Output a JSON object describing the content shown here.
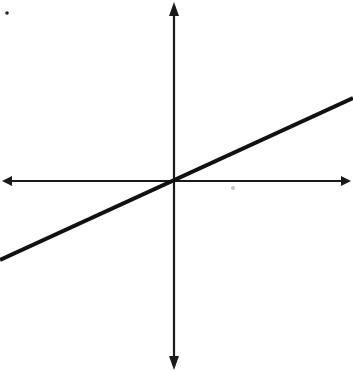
{
  "diagram": {
    "type": "coordinate-plane-linear-graph",
    "colors": {
      "background": "#ffffff",
      "axis": "#1a1a1a",
      "line": "#111111",
      "dot": "#222222",
      "smudge": "#9a9a9a"
    },
    "origin": {
      "x": 174,
      "y": 181
    },
    "x_axis": {
      "x1": 2,
      "x2": 351,
      "y": 181,
      "arrows": "both"
    },
    "y_axis": {
      "x": 174,
      "y1": 2,
      "y2": 370,
      "arrows": "both"
    },
    "line": {
      "x1": 0,
      "y1": 260,
      "x2": 353,
      "y2": 98,
      "passes_through_origin": true,
      "slope_sign": "positive"
    },
    "marks": [
      {
        "name": "corner-dot",
        "x": 7,
        "y": 13,
        "r": 1.8
      },
      {
        "name": "smudge",
        "x": 233,
        "y": 188,
        "r": 2
      }
    ]
  }
}
